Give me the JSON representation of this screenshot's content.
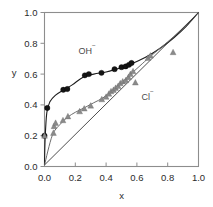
{
  "chart_data": {
    "type": "scatter",
    "title": "",
    "xlabel": "x",
    "ylabel": "y",
    "xlim": [
      0.0,
      1.0
    ],
    "ylim": [
      0.0,
      1.0
    ],
    "xticks": [
      "0.0",
      "0.2",
      "0.4",
      "0.6",
      "0.8",
      "1.0"
    ],
    "yticks": [
      "0.0",
      "0.2",
      "0.4",
      "0.6",
      "0.8",
      "1.0"
    ],
    "xtick_values": [
      0.0,
      0.2,
      0.4,
      0.6,
      0.8,
      1.0
    ],
    "ytick_values": [
      0.0,
      0.2,
      0.4,
      0.6,
      0.8,
      1.0
    ],
    "grid": false,
    "legend_position": "inline-annotations",
    "annotations": [
      {
        "text": "OH",
        "superscript": "−",
        "x": 0.22,
        "y": 0.73
      },
      {
        "text": "Cl",
        "superscript": "−",
        "x": 0.63,
        "y": 0.43
      }
    ],
    "series": [
      {
        "name": "OH−",
        "marker": "filled-circle",
        "color": "#141414",
        "points": [
          {
            "x": 0.0,
            "y": 0.2
          },
          {
            "x": 0.018,
            "y": 0.38
          },
          {
            "x": 0.122,
            "y": 0.498
          },
          {
            "x": 0.148,
            "y": 0.503
          },
          {
            "x": 0.262,
            "y": 0.592
          },
          {
            "x": 0.288,
            "y": 0.6
          },
          {
            "x": 0.37,
            "y": 0.608
          },
          {
            "x": 0.455,
            "y": 0.632
          },
          {
            "x": 0.5,
            "y": 0.645
          },
          {
            "x": 0.527,
            "y": 0.65
          },
          {
            "x": 0.548,
            "y": 0.66
          },
          {
            "x": 0.565,
            "y": 0.672
          }
        ],
        "fit_curve": [
          {
            "x": 0.0,
            "y": 0.01
          },
          {
            "x": 0.004,
            "y": 0.18
          },
          {
            "x": 0.015,
            "y": 0.35
          },
          {
            "x": 0.035,
            "y": 0.42
          },
          {
            "x": 0.07,
            "y": 0.462
          },
          {
            "x": 0.12,
            "y": 0.495
          },
          {
            "x": 0.18,
            "y": 0.53
          },
          {
            "x": 0.25,
            "y": 0.58
          },
          {
            "x": 0.32,
            "y": 0.6
          },
          {
            "x": 0.4,
            "y": 0.614
          },
          {
            "x": 0.47,
            "y": 0.634
          },
          {
            "x": 0.54,
            "y": 0.656
          },
          {
            "x": 0.61,
            "y": 0.686
          },
          {
            "x": 0.68,
            "y": 0.722
          },
          {
            "x": 0.76,
            "y": 0.774
          },
          {
            "x": 0.84,
            "y": 0.836
          },
          {
            "x": 0.92,
            "y": 0.91
          },
          {
            "x": 1.0,
            "y": 1.0
          }
        ]
      },
      {
        "name": "Cl−",
        "marker": "filled-triangle",
        "color": "#8a8a8a",
        "points": [
          {
            "x": 0.0,
            "y": 0.2
          },
          {
            "x": 0.058,
            "y": 0.218
          },
          {
            "x": 0.062,
            "y": 0.262
          },
          {
            "x": 0.072,
            "y": 0.283
          },
          {
            "x": 0.12,
            "y": 0.3
          },
          {
            "x": 0.152,
            "y": 0.325
          },
          {
            "x": 0.228,
            "y": 0.358
          },
          {
            "x": 0.258,
            "y": 0.376
          },
          {
            "x": 0.3,
            "y": 0.395
          },
          {
            "x": 0.372,
            "y": 0.436
          },
          {
            "x": 0.4,
            "y": 0.452
          },
          {
            "x": 0.418,
            "y": 0.472
          },
          {
            "x": 0.432,
            "y": 0.488
          },
          {
            "x": 0.448,
            "y": 0.497
          },
          {
            "x": 0.462,
            "y": 0.51
          },
          {
            "x": 0.478,
            "y": 0.522
          },
          {
            "x": 0.492,
            "y": 0.54
          },
          {
            "x": 0.508,
            "y": 0.552
          },
          {
            "x": 0.528,
            "y": 0.56
          },
          {
            "x": 0.545,
            "y": 0.58
          },
          {
            "x": 0.558,
            "y": 0.6
          },
          {
            "x": 0.575,
            "y": 0.618
          },
          {
            "x": 0.59,
            "y": 0.545
          },
          {
            "x": 0.672,
            "y": 0.705
          },
          {
            "x": 0.688,
            "y": 0.72
          },
          {
            "x": 0.835,
            "y": 0.742
          }
        ],
        "fit_curve": [
          {
            "x": 0.0,
            "y": 0.01
          },
          {
            "x": 0.05,
            "y": 0.2
          },
          {
            "x": 0.1,
            "y": 0.272
          },
          {
            "x": 0.15,
            "y": 0.32
          },
          {
            "x": 0.2,
            "y": 0.352
          },
          {
            "x": 0.26,
            "y": 0.382
          },
          {
            "x": 0.32,
            "y": 0.414
          },
          {
            "x": 0.38,
            "y": 0.446
          },
          {
            "x": 0.44,
            "y": 0.492
          },
          {
            "x": 0.5,
            "y": 0.544
          },
          {
            "x": 0.56,
            "y": 0.6
          },
          {
            "x": 0.62,
            "y": 0.654
          },
          {
            "x": 0.68,
            "y": 0.708
          },
          {
            "x": 0.76,
            "y": 0.776
          },
          {
            "x": 0.84,
            "y": 0.844
          },
          {
            "x": 0.92,
            "y": 0.918
          },
          {
            "x": 1.0,
            "y": 1.0
          }
        ]
      },
      {
        "name": "diagonal-reference",
        "marker": "none",
        "color": "#3a3a3a",
        "points": [],
        "fit_curve": [
          {
            "x": 0.0,
            "y": 0.01
          },
          {
            "x": 1.0,
            "y": 1.0
          }
        ]
      }
    ]
  }
}
